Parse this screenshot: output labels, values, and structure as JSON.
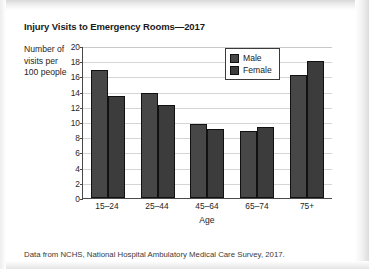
{
  "chart_data": {
    "type": "bar",
    "title": "Injury Visits to Emergency Rooms—2017",
    "xlabel": "Age",
    "ylabel": "Number of visits per 100 people",
    "ylabel_lines": [
      "Number of",
      "visits per",
      "100 people"
    ],
    "categories": [
      "15–24",
      "25–44",
      "45–64",
      "65–74",
      "75+"
    ],
    "series": [
      {
        "name": "Male",
        "color": "#474747",
        "values": [
          16.8,
          13.8,
          9.8,
          8.8,
          16.2
        ]
      },
      {
        "name": "Female",
        "color": "#3c3c3c",
        "values": [
          13.4,
          12.2,
          9.1,
          9.4,
          18.0
        ]
      }
    ],
    "ylim": [
      0,
      20
    ],
    "ytick_step": 2,
    "yticks": [
      "20",
      "18",
      "16",
      "14",
      "12",
      "10",
      "8",
      "6",
      "4",
      "2",
      "0"
    ],
    "grid": true,
    "legend_position": "upper-right-inside"
  },
  "legend": {
    "entries": [
      {
        "label": "Male",
        "swatch": "male"
      },
      {
        "label": "Female",
        "swatch": "female"
      }
    ]
  },
  "source_note": "Data from NCHS, National Hospital Ambulatory Medical Care Survey, 2017."
}
